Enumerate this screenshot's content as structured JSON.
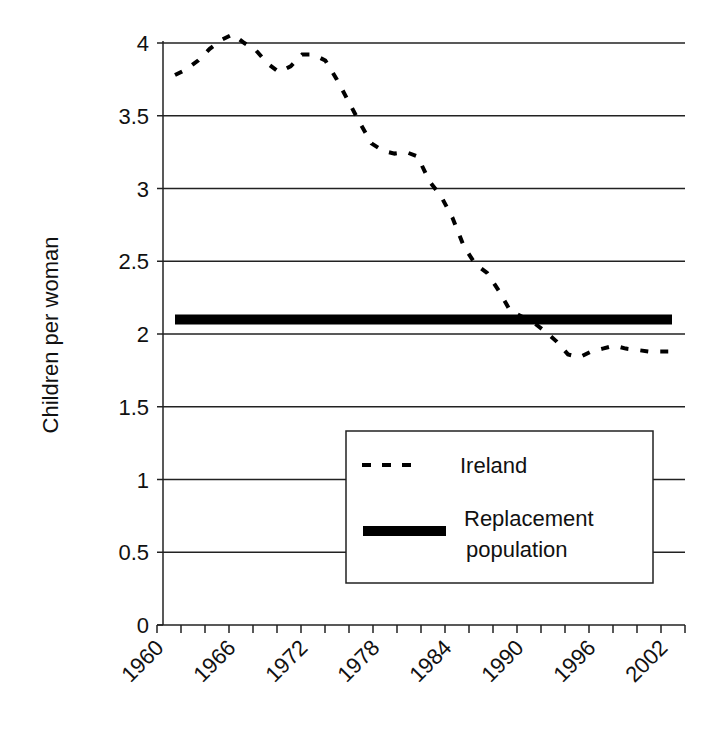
{
  "chart_data": {
    "type": "line",
    "title": "",
    "xlabel": "",
    "ylabel": "Children per woman",
    "ylim": [
      0,
      4
    ],
    "yticks": [
      0,
      0.5,
      1,
      1.5,
      2,
      2.5,
      3,
      3.5,
      4
    ],
    "ytick_labels": [
      "0",
      "0.5",
      "1",
      "1.5",
      "2",
      "2.5",
      "3",
      "3.5",
      "4"
    ],
    "xtick_labels": [
      "1960",
      "1966",
      "1972",
      "1978",
      "1984",
      "1990",
      "1996",
      "2002"
    ],
    "grid": true,
    "legend_position": "lower right inside",
    "x": [
      1960,
      1961,
      1962,
      1963,
      1964,
      1965,
      1966,
      1967,
      1968,
      1969,
      1970,
      1971,
      1972,
      1973,
      1974,
      1975,
      1976,
      1977,
      1978,
      1979,
      1980,
      1981,
      1982,
      1983,
      1984,
      1985,
      1986,
      1987,
      1988,
      1989,
      1990,
      1991,
      1992,
      1993,
      1994,
      1995,
      1996,
      1997,
      1998,
      1999,
      2000,
      2001,
      2002,
      2003
    ],
    "series": [
      {
        "name": "Ireland",
        "style": "dashed",
        "color": "#000000",
        "values": [
          3.78,
          3.82,
          3.88,
          3.96,
          4.02,
          4.06,
          4.0,
          3.95,
          3.86,
          3.8,
          3.84,
          3.92,
          3.92,
          3.88,
          3.75,
          3.6,
          3.45,
          3.31,
          3.26,
          3.24,
          3.25,
          3.22,
          3.05,
          2.95,
          2.8,
          2.6,
          2.48,
          2.42,
          2.3,
          2.16,
          2.12,
          2.08,
          2.02,
          1.95,
          1.86,
          1.84,
          1.88,
          1.9,
          1.92,
          1.9,
          1.89,
          1.88,
          1.88,
          1.88
        ]
      },
      {
        "name": "Replacement population",
        "style": "solid-thick",
        "color": "#000000",
        "values": [
          2.1,
          2.1,
          2.1,
          2.1,
          2.1,
          2.1,
          2.1,
          2.1,
          2.1,
          2.1,
          2.1,
          2.1,
          2.1,
          2.1,
          2.1,
          2.1,
          2.1,
          2.1,
          2.1,
          2.1,
          2.1,
          2.1,
          2.1,
          2.1,
          2.1,
          2.1,
          2.1,
          2.1,
          2.1,
          2.1,
          2.1,
          2.1,
          2.1,
          2.1,
          2.1,
          2.1,
          2.1,
          2.1,
          2.1,
          2.1,
          2.1,
          2.1,
          2.1,
          2.1
        ]
      }
    ],
    "legend": [
      {
        "label": "Ireland",
        "style": "dashed"
      },
      {
        "label": "Replacement population",
        "label_lines": [
          "Replacement",
          "population"
        ],
        "style": "solid-thick"
      }
    ]
  }
}
